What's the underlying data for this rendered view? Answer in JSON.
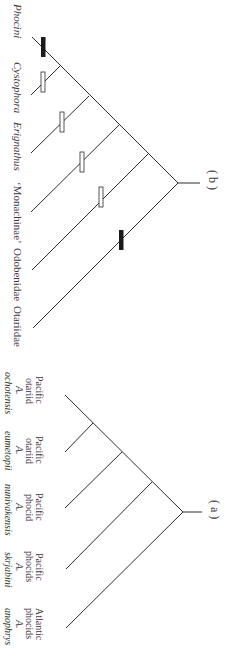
{
  "figure": {
    "panel_b": {
      "label": "( b )",
      "taxa": [
        {
          "name": "Phocini",
          "italic": true,
          "marker": "filled"
        },
        {
          "name": "Cystophora",
          "italic": true,
          "marker": "open"
        },
        {
          "name": "Erignathus",
          "italic": true,
          "marker": "open"
        },
        {
          "name": "‘Monachinae’",
          "italic": false,
          "marker": "open"
        },
        {
          "name": "Odobenidae",
          "italic": false,
          "marker": "open"
        },
        {
          "name": "Otariidae",
          "italic": false,
          "marker": "filled"
        }
      ]
    },
    "panel_a": {
      "label": "( a )",
      "taxa": [
        {
          "group_line1": "Pacific",
          "group_line2": "otariid",
          "genus": "A.",
          "species": "ochotensis"
        },
        {
          "group_line1": "Pacific",
          "group_line2": "otariid",
          "genus": "A.",
          "species": "eumetopii"
        },
        {
          "group_line1": "Pacific",
          "group_line2": "phocid",
          "genus": "A.",
          "species": "nunivakensis"
        },
        {
          "group_line1": "Pacific",
          "group_line2": "phocids",
          "genus": "A.",
          "species": "skrjabini"
        },
        {
          "group_line1": "Atlantic",
          "group_line2": "phocids",
          "genus": "A.",
          "species": "anophrys"
        }
      ]
    },
    "colors": {
      "line": "#2e2e2e",
      "text": "#3a3a3a",
      "filled_marker": "#1a1a1a",
      "open_marker": "#ffffff"
    }
  }
}
